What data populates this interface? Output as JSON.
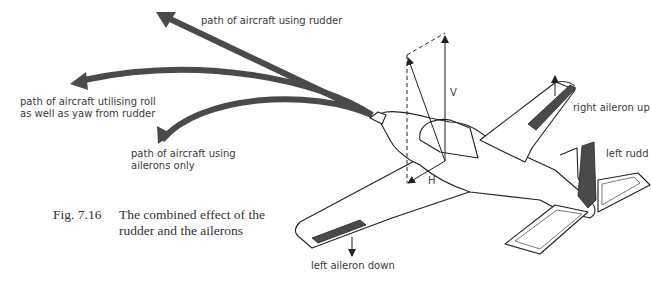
{
  "figure": {
    "number": "Fig. 7.16",
    "caption_line1": "The combined effect of the",
    "caption_line2": "rudder and the ailerons"
  },
  "paths": {
    "rudder": "path of aircraft using rudder",
    "roll_yaw_line1": "path of aircraft utilising roll",
    "roll_yaw_line2": "as well as yaw from rudder",
    "ailerons_line1": "path of aircraft using",
    "ailerons_line2": "ailerons only"
  },
  "aircraft_labels": {
    "right_aileron": "right aileron up",
    "left_rudder": "left rudd",
    "left_aileron": "left aileron down"
  },
  "vectors": {
    "vertical": "V",
    "horizontal": "H"
  },
  "colors": {
    "arrow": "#4a4a4a",
    "line": "#222222",
    "control_surface": "#4a4a4a",
    "text": "#3a3a3a"
  }
}
